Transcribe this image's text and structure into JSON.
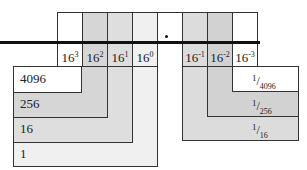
{
  "diagram": {
    "title": "",
    "columns": [
      {
        "base": "16",
        "exp": "3",
        "shade": "#ffffff"
      },
      {
        "base": "16",
        "exp": "2",
        "shade": "#d6d6d6"
      },
      {
        "base": "16",
        "exp": "1",
        "shade": "#dedede"
      },
      {
        "base": "16",
        "exp": "0",
        "shade": "#f0f0f0"
      },
      {
        "base": "",
        "exp": "",
        "shade": "#ffffff",
        "is_point": true
      },
      {
        "base": "16",
        "exp": "-1",
        "shade": "#dcdcdc"
      },
      {
        "base": "16",
        "exp": "-2",
        "shade": "#d2d2d2"
      },
      {
        "base": "16",
        "exp": "-3",
        "shade": "#ffffff"
      }
    ],
    "radix_point": ".",
    "integer_place_values": [
      {
        "value": "4096",
        "shade": "#ffffff"
      },
      {
        "value": "256",
        "shade": "#d6d6d6"
      },
      {
        "value": "16",
        "shade": "#dedede"
      },
      {
        "value": "1",
        "shade": "#f0f0f0"
      }
    ],
    "fraction_place_values": [
      {
        "numerator": "1",
        "denominator": "4096",
        "shade": "#ffffff"
      },
      {
        "numerator": "1",
        "denominator": "256",
        "shade": "#d2d2d2"
      },
      {
        "numerator": "1",
        "denominator": "16",
        "shade": "#dcdcdc"
      }
    ]
  }
}
